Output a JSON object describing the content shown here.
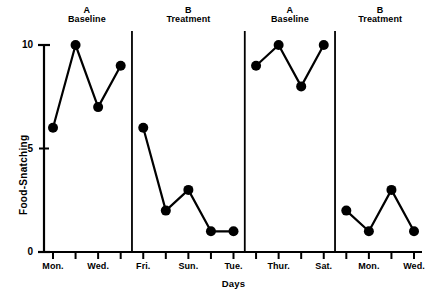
{
  "chart_data": {
    "type": "line",
    "title": "",
    "xlabel": "Days",
    "ylabel": "Food-Snatching",
    "ylim": [
      0,
      10
    ],
    "ytick_values": [
      0,
      5,
      10
    ],
    "ytick_labels": [
      "0",
      "5",
      "10"
    ],
    "xlim": [
      1,
      17
    ],
    "grid": false,
    "legend": "none",
    "design": "ABAB reversal",
    "phases": [
      {
        "letter": "A",
        "name": "Baseline",
        "day_indices": [
          1,
          2,
          3,
          4
        ],
        "values": [
          6,
          10,
          7,
          9
        ]
      },
      {
        "letter": "B",
        "name": "Treatment",
        "day_indices": [
          5,
          6,
          7,
          8,
          9
        ],
        "values": [
          6,
          2,
          3,
          1,
          1
        ]
      },
      {
        "letter": "A",
        "name": "Baseline",
        "day_indices": [
          10,
          11,
          12,
          13
        ],
        "values": [
          9,
          10,
          8,
          10
        ]
      },
      {
        "letter": "B",
        "name": "Treatment",
        "day_indices": [
          14,
          15,
          16,
          17
        ],
        "values": [
          2,
          1,
          3,
          1
        ]
      }
    ],
    "x_tick_count": 17,
    "x_tick_labels": [
      {
        "index": 1,
        "label": "Mon."
      },
      {
        "index": 3,
        "label": "Wed."
      },
      {
        "index": 5,
        "label": "Fri."
      },
      {
        "index": 7,
        "label": "Sun."
      },
      {
        "index": 9,
        "label": "Tue."
      },
      {
        "index": 11,
        "label": "Thur."
      },
      {
        "index": 13,
        "label": "Sat."
      },
      {
        "index": 15,
        "label": "Mon."
      },
      {
        "index": 17,
        "label": "Wed."
      }
    ],
    "phase_divider_indices": [
      4.5,
      9.5,
      13.5
    ],
    "series_color": "#000000",
    "marker": "filled-circle"
  }
}
